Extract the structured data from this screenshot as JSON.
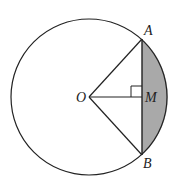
{
  "diagram": {
    "type": "circle-geometry",
    "circle": {
      "center_label": "O",
      "cx": 89,
      "cy": 97,
      "r": 78
    },
    "points": [
      {
        "label": "O",
        "x": 89,
        "y": 97
      },
      {
        "label": "A",
        "x": 142,
        "y": 39
      },
      {
        "label": "B",
        "x": 142,
        "y": 155
      },
      {
        "label": "M",
        "x": 142,
        "y": 97
      }
    ],
    "segments": [
      "OA",
      "OB",
      "OM",
      "AB"
    ],
    "right_angle_at": "M",
    "shaded_region": "segment between chord AB and minor arc AB",
    "colors": {
      "stroke": "#222222",
      "shade": "#a9a9a9",
      "background": "#ffffff"
    },
    "labels": {
      "A": "A",
      "B": "B",
      "O": "O",
      "M": "M"
    }
  }
}
